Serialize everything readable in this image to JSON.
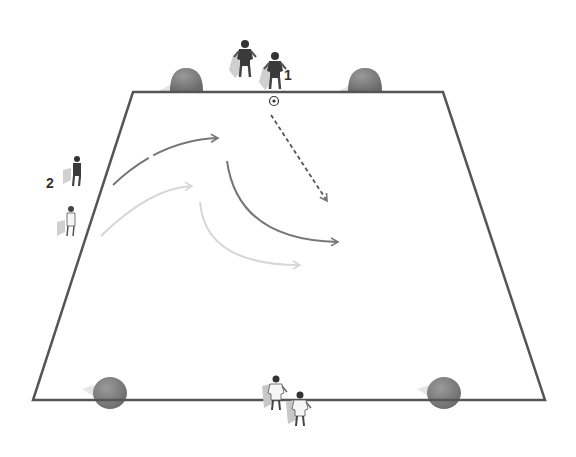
{
  "diagram": {
    "type": "soccer-drill",
    "field": {
      "shape": "trapezoid",
      "corners": {
        "top_left": [
          133,
          92
        ],
        "top_right": [
          443,
          92
        ],
        "bottom_right": [
          545,
          400
        ],
        "bottom_left": [
          33,
          400
        ]
      },
      "line_color": "#555555"
    },
    "labels": [
      {
        "id": "group-1",
        "text": "1",
        "x": 288,
        "y": 79
      },
      {
        "id": "group-2",
        "text": "2",
        "x": 50,
        "y": 187
      }
    ],
    "goals": [
      {
        "id": "goal-top-left",
        "x": 185,
        "y": 84
      },
      {
        "id": "goal-top-right",
        "x": 365,
        "y": 84
      },
      {
        "id": "goal-bottom-left",
        "x": 109,
        "y": 393
      },
      {
        "id": "goal-bottom-right",
        "x": 444,
        "y": 393
      }
    ],
    "ball": {
      "x": 274,
      "y": 101
    },
    "players": [
      {
        "team": "dark",
        "x": 245,
        "y": 60
      },
      {
        "team": "dark",
        "x": 275,
        "y": 72
      },
      {
        "team": "dark",
        "x": 76,
        "y": 172
      },
      {
        "team": "light",
        "x": 70,
        "y": 222
      },
      {
        "team": "light",
        "x": 276,
        "y": 395
      },
      {
        "team": "light",
        "x": 299,
        "y": 410
      }
    ],
    "colors": {
      "dark_player": "#3a3a3a",
      "light_player": "#f2f2f2",
      "goal": "#7a7a7a",
      "arrow_dark": "#777777",
      "arrow_light": "#d6d6d6"
    }
  }
}
